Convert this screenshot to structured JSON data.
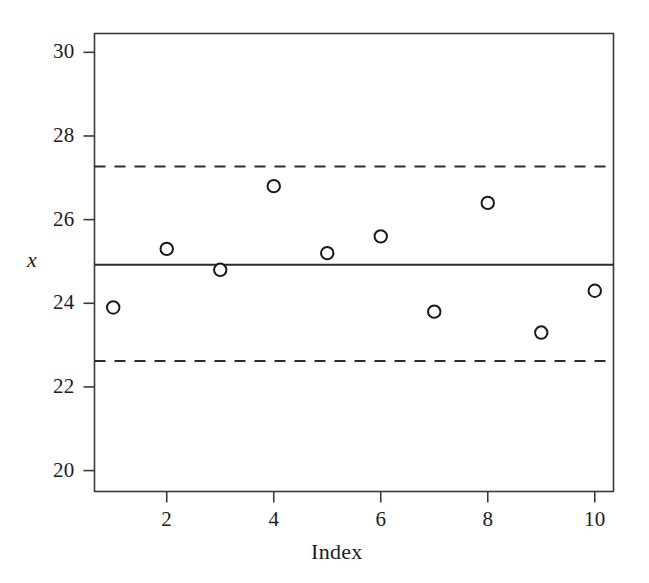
{
  "chart_data": {
    "type": "scatter",
    "title": "",
    "xlabel": "Index",
    "ylabel": "x",
    "x": [
      1,
      2,
      3,
      4,
      5,
      6,
      7,
      8,
      9,
      10
    ],
    "values": [
      23.9,
      25.3,
      24.8,
      26.8,
      25.2,
      25.6,
      23.8,
      26.4,
      23.3,
      24.3
    ],
    "series": [
      {
        "name": "x",
        "values": [
          23.9,
          25.3,
          24.8,
          26.8,
          25.2,
          25.6,
          23.8,
          26.4,
          23.3,
          24.3
        ]
      }
    ],
    "xlim": [
      0.65,
      10.35
    ],
    "ylim": [
      19.5,
      30.45
    ],
    "xticks": [
      2,
      4,
      6,
      8,
      10
    ],
    "xtick_labels": [
      "2",
      "4",
      "6",
      "8",
      "10"
    ],
    "yticks": [
      20,
      22,
      24,
      26,
      28,
      30
    ],
    "ytick_labels": [
      "20",
      "22",
      "24",
      "26",
      "28",
      "30"
    ],
    "grid": false,
    "legend": "none",
    "marker": "open-circle",
    "reference_lines": [
      {
        "name": "upper-control-limit",
        "value": 27.27,
        "style": "dashed"
      },
      {
        "name": "center-line",
        "value": 24.92,
        "style": "solid"
      },
      {
        "name": "lower-control-limit",
        "value": 22.62,
        "style": "dashed"
      }
    ],
    "colors": {
      "axis": "#3a3a3a",
      "marker_stroke": "#1a1a1a",
      "marker_fill": "#ffffff",
      "center_line": "#2b2b2b",
      "limit_line": "#2b2b2b",
      "background": "#ffffff"
    }
  },
  "axes": {
    "y_axis_label": "x",
    "x_axis_label": "Index"
  }
}
